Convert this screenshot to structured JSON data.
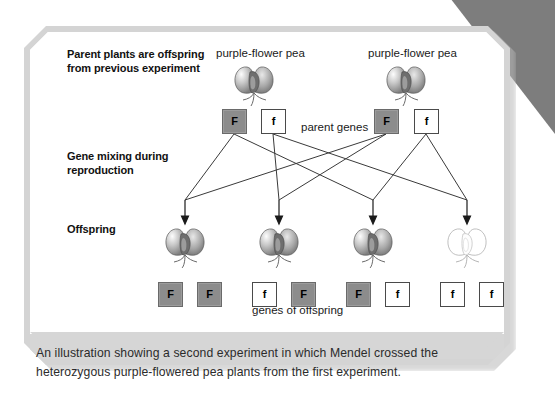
{
  "figure": {
    "type": "genetics-punnett-cross-diagram",
    "row_labels": {
      "parents_line1": "Parent plants are offspring",
      "parents_line2": "from previous experiment",
      "mixing_line1": "Gene mixing during",
      "mixing_line2": "reproduction",
      "offspring": "Offspring"
    },
    "parents": {
      "left": {
        "caption": "purple-flower pea",
        "genes": [
          "F",
          "f"
        ],
        "flower_color": "purple"
      },
      "right": {
        "caption": "purple-flower pea",
        "genes": [
          "F",
          "f"
        ],
        "flower_color": "purple"
      },
      "genes_label": "parent genes"
    },
    "offspring": {
      "genes_label": "genes of offspring",
      "individuals": [
        {
          "genes": [
            "F",
            "F"
          ],
          "flower_color": "purple"
        },
        {
          "genes": [
            "f",
            "F"
          ],
          "flower_color": "purple"
        },
        {
          "genes": [
            "F",
            "f"
          ],
          "flower_color": "purple"
        },
        {
          "genes": [
            "f",
            "f"
          ],
          "flower_color": "white"
        }
      ]
    },
    "colors": {
      "dominant_allele_box_fill": "#8c8c8c",
      "recessive_allele_box_fill": "#ffffff",
      "card_border": "#d4d4d4",
      "caption_panel": "#d6d6d6",
      "corner_fold": "#7d7d7d"
    }
  },
  "caption": {
    "line1": "An illustration showing a second experiment in which Mendel crossed the",
    "line2": "heterozygous purple-flowered pea plants from the first experiment."
  }
}
